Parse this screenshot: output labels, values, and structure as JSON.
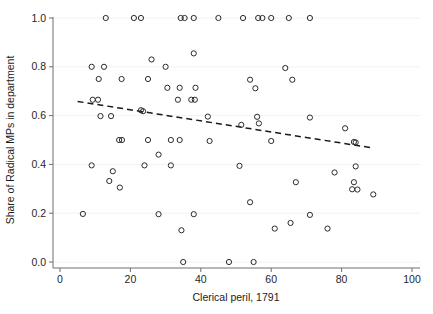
{
  "chart_data": {
    "type": "scatter",
    "title": "",
    "xlabel": "Clerical peril, 1791",
    "ylabel": "Share of Radical MPs in department",
    "xlim": [
      0,
      100
    ],
    "ylim": [
      0.0,
      1.0
    ],
    "xticks": [
      0,
      20,
      40,
      60,
      80,
      100
    ],
    "yticks": [
      "0.0",
      "0.2",
      "0.4",
      "0.6",
      "0.8",
      "1.0"
    ],
    "ytick_values": [
      0.0,
      0.2,
      0.4,
      0.6,
      0.8,
      1.0
    ],
    "grid": "horizontal-faint",
    "legend": "none",
    "marker": "open-circle",
    "marker_color": "#2b2b2b",
    "points": [
      [
        13.0,
        1.0
      ],
      [
        21.0,
        1.0
      ],
      [
        23.0,
        1.0
      ],
      [
        34.3,
        1.0
      ],
      [
        35.4,
        1.0
      ],
      [
        38.0,
        1.0
      ],
      [
        45.0,
        1.0
      ],
      [
        52.0,
        1.0
      ],
      [
        56.3,
        1.0
      ],
      [
        57.5,
        1.0
      ],
      [
        60.0,
        1.0
      ],
      [
        65.0,
        1.0
      ],
      [
        71.0,
        1.0
      ],
      [
        38.0,
        0.855
      ],
      [
        26.0,
        0.83
      ],
      [
        9.0,
        0.8
      ],
      [
        12.5,
        0.8
      ],
      [
        64.0,
        0.795
      ],
      [
        11.0,
        0.75
      ],
      [
        17.5,
        0.75
      ],
      [
        25.0,
        0.75
      ],
      [
        54.0,
        0.747
      ],
      [
        66.0,
        0.747
      ],
      [
        30.0,
        0.8
      ],
      [
        30.5,
        0.714
      ],
      [
        34.0,
        0.714
      ],
      [
        38.5,
        0.714
      ],
      [
        55.5,
        0.712
      ],
      [
        33.5,
        0.665
      ],
      [
        37.3,
        0.665
      ],
      [
        38.3,
        0.665
      ],
      [
        9.3,
        0.665
      ],
      [
        10.8,
        0.665
      ],
      [
        23.0,
        0.622
      ],
      [
        23.6,
        0.618
      ],
      [
        11.5,
        0.598
      ],
      [
        14.5,
        0.598
      ],
      [
        42.0,
        0.596
      ],
      [
        56.0,
        0.595
      ],
      [
        71.0,
        0.592
      ],
      [
        51.5,
        0.562
      ],
      [
        56.5,
        0.568
      ],
      [
        81.0,
        0.548
      ],
      [
        16.8,
        0.5
      ],
      [
        17.6,
        0.5
      ],
      [
        25.0,
        0.5
      ],
      [
        31.5,
        0.5
      ],
      [
        34.0,
        0.5
      ],
      [
        42.5,
        0.496
      ],
      [
        60.0,
        0.496
      ],
      [
        83.5,
        0.492
      ],
      [
        84.0,
        0.49
      ],
      [
        28.0,
        0.44
      ],
      [
        9.0,
        0.396
      ],
      [
        24.0,
        0.396
      ],
      [
        31.5,
        0.396
      ],
      [
        51.0,
        0.394
      ],
      [
        84.0,
        0.392
      ],
      [
        78.0,
        0.367
      ],
      [
        15.0,
        0.372
      ],
      [
        83.5,
        0.327
      ],
      [
        67.0,
        0.327
      ],
      [
        14.0,
        0.332
      ],
      [
        83.0,
        0.298
      ],
      [
        84.5,
        0.297
      ],
      [
        17.0,
        0.305
      ],
      [
        89.0,
        0.277
      ],
      [
        54.0,
        0.245
      ],
      [
        6.5,
        0.197
      ],
      [
        28.0,
        0.196
      ],
      [
        38.0,
        0.196
      ],
      [
        71.0,
        0.193
      ],
      [
        65.5,
        0.16
      ],
      [
        34.5,
        0.13
      ],
      [
        61.0,
        0.137
      ],
      [
        76.0,
        0.137
      ],
      [
        35.0,
        0.0
      ],
      [
        48.0,
        0.0
      ],
      [
        55.0,
        0.0
      ]
    ],
    "fit_line": {
      "type": "dashed-linear-fit",
      "x_start": 5.0,
      "y_start": 0.658,
      "x_end": 89.0,
      "y_end": 0.467,
      "color": "#1a1a1a",
      "dash": "dashed"
    }
  }
}
